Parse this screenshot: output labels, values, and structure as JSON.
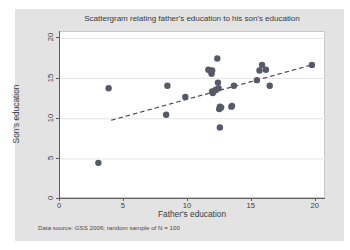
{
  "chart_data": {
    "type": "scatter",
    "title": "Scattergram relating father's education to his son's education",
    "xlabel": "Father's education",
    "ylabel": "Son's education",
    "note": "Data source: GSS 2006; random sample of N = 100",
    "xlim": [
      0,
      20.8
    ],
    "ylim": [
      0,
      20.8
    ],
    "xticks": [
      0,
      5,
      10,
      15,
      20
    ],
    "yticks": [
      0,
      5,
      10,
      15,
      20
    ],
    "xtick_labels": [
      "0",
      "5",
      "10",
      "15",
      "20"
    ],
    "ytick_labels": [
      "0",
      "5",
      "10",
      "15",
      "20"
    ],
    "grid": "horizontal",
    "gridlines_y": [
      5,
      10,
      15,
      20
    ],
    "legend": "none",
    "marker_color": "#555a66",
    "marker_size": 3.2,
    "points": [
      {
        "x": 3.0,
        "y": 4.5
      },
      {
        "x": 3.8,
        "y": 13.8
      },
      {
        "x": 8.3,
        "y": 10.5
      },
      {
        "x": 8.4,
        "y": 14.1
      },
      {
        "x": 9.8,
        "y": 12.7
      },
      {
        "x": 11.6,
        "y": 16.1
      },
      {
        "x": 11.8,
        "y": 15.9
      },
      {
        "x": 11.85,
        "y": 15.6
      },
      {
        "x": 11.9,
        "y": 16.0
      },
      {
        "x": 11.9,
        "y": 13.4
      },
      {
        "x": 11.95,
        "y": 13.2
      },
      {
        "x": 12.1,
        "y": 13.5
      },
      {
        "x": 12.2,
        "y": 13.6
      },
      {
        "x": 12.3,
        "y": 17.5
      },
      {
        "x": 12.35,
        "y": 14.5
      },
      {
        "x": 12.4,
        "y": 13.8
      },
      {
        "x": 12.45,
        "y": 11.2
      },
      {
        "x": 12.5,
        "y": 11.5
      },
      {
        "x": 12.5,
        "y": 8.9
      },
      {
        "x": 12.6,
        "y": 11.4
      },
      {
        "x": 13.4,
        "y": 11.5
      },
      {
        "x": 13.45,
        "y": 11.6
      },
      {
        "x": 13.6,
        "y": 14.1
      },
      {
        "x": 15.4,
        "y": 14.8
      },
      {
        "x": 15.6,
        "y": 16.0
      },
      {
        "x": 15.8,
        "y": 16.7
      },
      {
        "x": 16.1,
        "y": 16.1
      },
      {
        "x": 16.4,
        "y": 14.1
      },
      {
        "x": 19.7,
        "y": 16.7
      }
    ],
    "fit_line": {
      "style": "dashed",
      "color": "#4a4a4a",
      "x_start": 4.0,
      "y_start": 9.8,
      "x_end": 19.9,
      "y_end": 16.8
    }
  }
}
